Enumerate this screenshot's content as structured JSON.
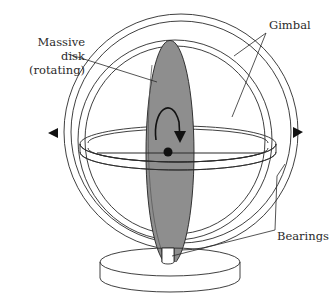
{
  "diagram": {
    "labels": {
      "disk_line1": "Massive",
      "disk_line2": "disk",
      "disk_line3": "(rotating)",
      "gimbal": "Gimbal",
      "bearings": "Bearings"
    },
    "colors": {
      "line": "#2a2a2a",
      "disk_fill": "#8e8e8e",
      "disk_edge": "#6a6a6a",
      "background": "#ffffff"
    },
    "components": [
      "outer gimbal ring",
      "inner gimbal ring",
      "horizontal ring",
      "massive rotating disk",
      "axle",
      "pivot arrows",
      "stand post",
      "base"
    ]
  }
}
